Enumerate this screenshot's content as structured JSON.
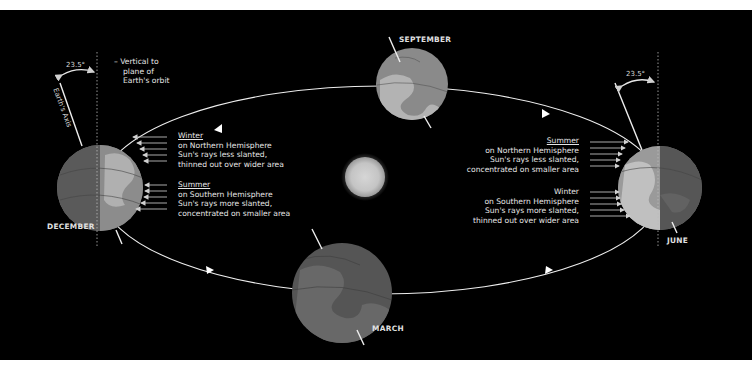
{
  "diagram": {
    "colors": {
      "background": "#000000",
      "orbit": "#f0f0f0",
      "earth_light": "#8e8e8e",
      "earth_dark": "#555555",
      "land_light": "#b5b5b5",
      "sun": "#cfcfcf",
      "text": "#e6e6e6"
    },
    "labels": {
      "vertical_note": [
        "– Vertical to",
        "plane of",
        "Earth's orbit"
      ],
      "axis_label": "Earth's Axis",
      "tilt_left": "23.5°",
      "tilt_right": "23.5°"
    },
    "positions": [
      {
        "id": "december",
        "label": "DECEMBER"
      },
      {
        "id": "september",
        "label": "SEPTEMBER"
      },
      {
        "id": "june",
        "label": "JUNE"
      },
      {
        "id": "march",
        "label": "MARCH"
      }
    ],
    "december_notes": {
      "north": {
        "heading": "Winter",
        "lines": [
          "on Northern Hemisphere",
          "Sun's rays less slanted,",
          "thinned out over wider area"
        ]
      },
      "south": {
        "heading": "Summer",
        "lines": [
          "on Southern Hemisphere",
          "Sun's rays more slanted,",
          "concentrated on smaller area"
        ]
      }
    },
    "june_notes": {
      "north": {
        "heading": "Summer",
        "lines": [
          "on Northern Hemisphere",
          "Sun's rays less slanted,",
          "concentrated on smaller area"
        ]
      },
      "south": {
        "heading": "Winter",
        "lines": [
          "on Southern Hemisphere",
          "Sun's rays more slanted,",
          "thinned out over wider area"
        ]
      }
    },
    "center": {
      "label": "Sun"
    }
  }
}
